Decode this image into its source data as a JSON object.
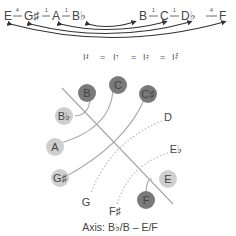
{
  "sequence": {
    "notes": [
      "E",
      "G♯",
      "A",
      "B♭",
      "B",
      "C",
      "D♭",
      "F"
    ],
    "intervals": [
      "4",
      "1",
      "1",
      "",
      "1",
      "1",
      "4"
    ]
  },
  "equivalence_row": {
    "text": "I𝄪 = I𝄫 = I♮ = I♭",
    "items": [
      "IF",
      "IG♯",
      "IC",
      "IB♭"
    ],
    "separator": "="
  },
  "diagram": {
    "filled_circles": [
      {
        "label": "B",
        "shade": "dark"
      },
      {
        "label": "C",
        "shade": "dark"
      },
      {
        "label": "C♯",
        "shade": "dark"
      },
      {
        "label": "B♭",
        "shade": "light"
      },
      {
        "label": "A",
        "shade": "light"
      },
      {
        "label": "G♯",
        "shade": "light"
      },
      {
        "label": "E",
        "shade": "light"
      },
      {
        "label": "F",
        "shade": "dark"
      }
    ],
    "plain_labels": [
      "D",
      "E♭",
      "G",
      "F♯"
    ],
    "axis_label": "Axis: B♭/B – E/F"
  },
  "colors": {
    "dark_circle": "#7a7a7a",
    "light_circle": "#cfcfcf",
    "line": "#a8a8a8",
    "dotted": "#b5b5b5",
    "text": "#444444"
  }
}
